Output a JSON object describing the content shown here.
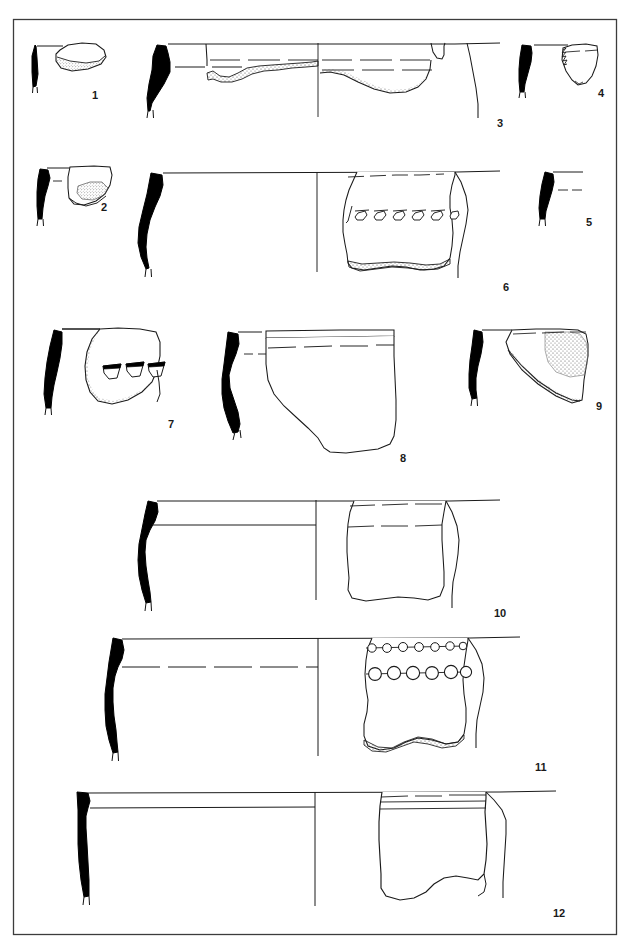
{
  "plate": {
    "type": "archaeological-pottery-illustration-plate",
    "frame": {
      "x": 13,
      "y": 19,
      "width": 604,
      "height": 916,
      "stroke": "#3c3c3c"
    },
    "background_color": "#ffffff",
    "ink_color": "#1a1a1a",
    "section_fill_color": "#000000",
    "stipple_color": "#555555",
    "figure_count": 12,
    "caption_cut_off": true,
    "caption_text": "",
    "figures": [
      {
        "number": "1",
        "label_x": 92,
        "label_y": 95,
        "description": "small rim sherd, black section at left, stippled broken lower edge",
        "has_section": true,
        "has_sherd": true,
        "decoration": "none"
      },
      {
        "number": "2",
        "label_x": 101,
        "label_y": 207,
        "description": "rim sherd with black S-profile and small stippled patch",
        "has_section": true,
        "has_sherd": true,
        "decoration": "none"
      },
      {
        "number": "3",
        "label_x": 503,
        "label_y": 123,
        "description": "large open bowl rim with dashed interior lines and stippled broken edges",
        "has_section": true,
        "has_sherd": true,
        "decoration": "dashed-bands"
      },
      {
        "number": "4",
        "label_x": 601,
        "label_y": 93,
        "description": "small trapezoidal rim sherd with notched left edge",
        "has_section": true,
        "has_sherd": true,
        "decoration": "none"
      },
      {
        "number": "5",
        "label_x": 601,
        "label_y": 222,
        "description": "rim profile only, black section with rim line and dashed line",
        "has_section": true,
        "has_sherd": false,
        "decoration": "none"
      },
      {
        "number": "6",
        "label_x": 506,
        "label_y": 287,
        "description": "large vessel rim; sherd bears a horizontal row of slanted teardrop punctates",
        "has_section": true,
        "has_sherd": true,
        "decoration": "row-of-slanted-punctates",
        "decoration_count": 7
      },
      {
        "number": "7",
        "label_x": 172,
        "label_y": 424,
        "description": "body sherd with three wedge/triangular impressions, stippled broken edges",
        "has_section": true,
        "has_sherd": true,
        "decoration": "three-wedge-impressions",
        "decoration_count": 3
      },
      {
        "number": "8",
        "label_x": 404,
        "label_y": 458,
        "description": "S-profile vessel with broad plain sherd and dashed horizontal line",
        "has_section": true,
        "has_sherd": true,
        "decoration": "dashed-band"
      },
      {
        "number": "9",
        "label_x": 600,
        "label_y": 405,
        "description": "triangular rim sherd with stippled zone upper right",
        "has_section": true,
        "has_sherd": true,
        "decoration": "stippled-zone"
      },
      {
        "number": "10",
        "label_x": 500,
        "label_y": 613,
        "description": "wide vessel, black S-section, rim lines, plain sherd with dashed bands",
        "has_section": true,
        "has_sherd": true,
        "decoration": "dashed-bands"
      },
      {
        "number": "11",
        "label_x": 541,
        "label_y": 767,
        "description": "vessel with two horizontal rows of circular bosses/impressions",
        "has_section": true,
        "has_sherd": true,
        "decoration": "two-rows-of-circular-bosses",
        "decoration_rows": [
          {
            "row": 1,
            "count": 7,
            "size": "small"
          },
          {
            "row": 2,
            "count": 6,
            "size": "large"
          }
        ]
      },
      {
        "number": "12",
        "label_x": 559,
        "label_y": 913,
        "description": "wide vessel with straight black section and horizontal banded lines below rim",
        "has_section": true,
        "has_sherd": true,
        "decoration": "horizontal-bands"
      }
    ]
  }
}
